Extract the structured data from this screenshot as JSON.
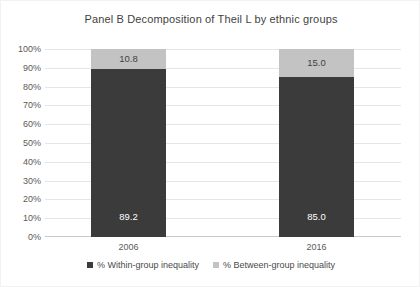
{
  "chart_data": {
    "type": "bar",
    "subtype": "stacked-100-percent",
    "title": "Panel B Decomposition of Theil L by ethnic groups",
    "xlabel": "",
    "ylabel": "",
    "categories": [
      "2006",
      "2016"
    ],
    "series": [
      {
        "name": "% Within-group inequality",
        "color": "#3b3b3b",
        "values": [
          89.2,
          85.0
        ],
        "labels": [
          "89.2",
          "85.0"
        ]
      },
      {
        "name": "% Between-group inequality",
        "color": "#c3c3c3",
        "values": [
          10.8,
          15.0
        ],
        "labels": [
          "10.8",
          "15.0"
        ]
      }
    ],
    "ylim": [
      0,
      100
    ],
    "yticks": [
      0,
      10,
      20,
      30,
      40,
      50,
      60,
      70,
      80,
      90,
      100
    ],
    "ytick_labels": [
      "0%",
      "10%",
      "20%",
      "30%",
      "40%",
      "50%",
      "60%",
      "70%",
      "80%",
      "90%",
      "100%"
    ],
    "grid": true,
    "grid_axis": "y",
    "legend_position": "bottom",
    "legend_entries": [
      "% Within-group inequality",
      "% Between-group inequality"
    ],
    "background_color": "#ffffff",
    "gridline_color": "#e6e6e6",
    "text_color": "#3f3f3f"
  }
}
